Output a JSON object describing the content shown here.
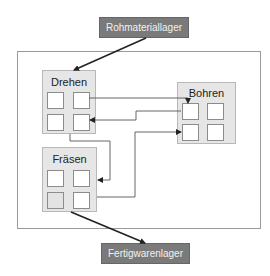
{
  "diagram": {
    "source_storage": {
      "label": "Rohmateriallager"
    },
    "target_storage": {
      "label": "Fertigwarenlager"
    },
    "stations": [
      {
        "id": "drehen",
        "label": "Drehen",
        "cells": 4
      },
      {
        "id": "bohren",
        "label": "Bohren",
        "cells": 4
      },
      {
        "id": "fraesen",
        "label": "Fräsen",
        "cells": 4
      }
    ],
    "flows": [
      {
        "from": "Rohmateriallager",
        "to": "Drehen"
      },
      {
        "from": "Drehen",
        "to": "Bohren"
      },
      {
        "from": "Bohren",
        "to": "Drehen"
      },
      {
        "from": "Drehen",
        "to": "Fräsen"
      },
      {
        "from": "Fräsen",
        "to": "Bohren"
      },
      {
        "from": "Fräsen",
        "to": "Fertigwarenlager"
      }
    ],
    "colors": {
      "storage_fill": "#7a7a7a",
      "station_fill": "#e6e6e6",
      "frame_border": "#9a9a9a",
      "arrow": "#222222"
    }
  }
}
